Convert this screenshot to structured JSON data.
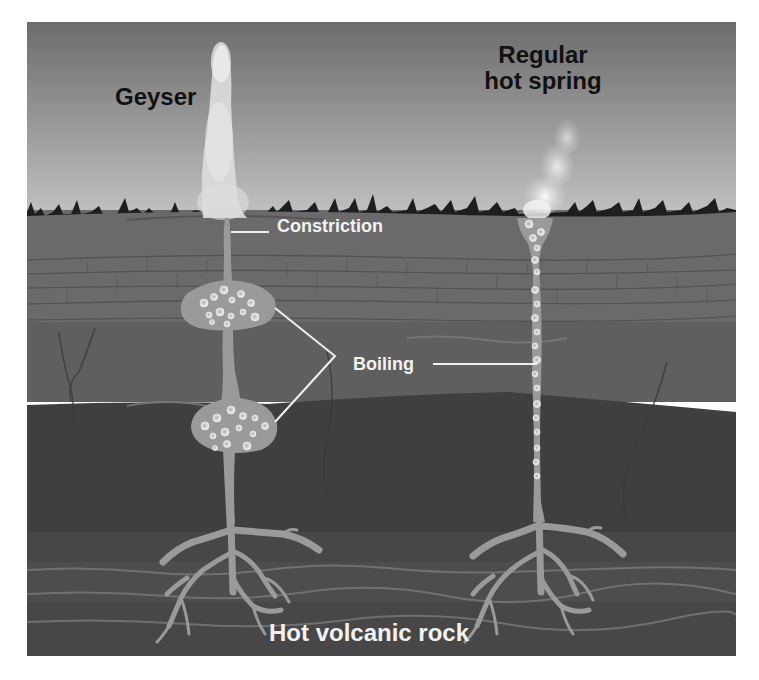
{
  "diagram": {
    "labels": {
      "geyser": "Geyser",
      "hot_spring_line1": "Regular",
      "hot_spring_line2": "hot spring",
      "constriction": "Constriction",
      "boiling": "Boiling",
      "hot_volcanic_rock": "Hot volcanic rock"
    },
    "colors": {
      "sky_top": "#6e6e6e",
      "sky_bottom": "#b8b8b8",
      "ground_top": "#6a6a6a",
      "layer_mid": "#5e5e5e",
      "layer_dark": "#3e3e3e",
      "layer_bottom": "#4a4a4a",
      "water": "#9a9a9a",
      "text_dark": "#111111",
      "text_light": "#f2f2f2"
    }
  }
}
